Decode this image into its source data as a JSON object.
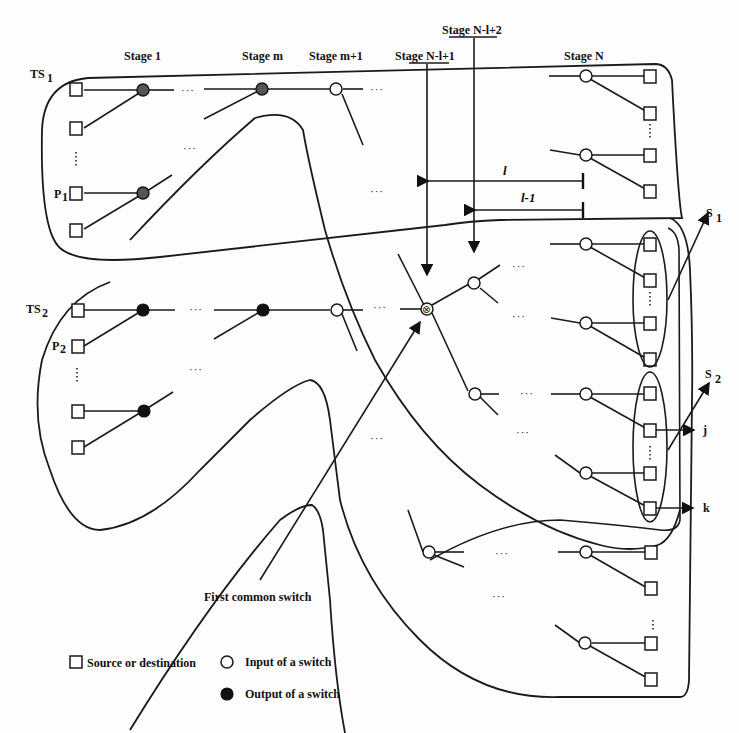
{
  "diagram": {
    "stage_labels": {
      "stage_1": "Stage 1",
      "stage_m": "Stage m",
      "stage_m1": "Stage m+1",
      "stage_nl1": "Stage N-l+1",
      "stage_nl2": "Stage N-l+2",
      "stage_n": "Stage N"
    },
    "group_labels": {
      "ts1": "TS",
      "ts1_sub": "1",
      "p1": "P",
      "p1_sub": "1",
      "ts2": "TS",
      "ts2_sub": "2",
      "p2": "P",
      "p2_sub": "2"
    },
    "dimension_labels": {
      "l": "l",
      "l_minus_1": "l-1"
    },
    "side_labels": {
      "s1": "S",
      "s1_sub": "1",
      "s2": "S",
      "s2_sub": "2",
      "j": "j",
      "k": "k"
    },
    "annotation": "First common switch",
    "ellipsis": "···"
  },
  "legend": {
    "source_destination": "Source or destination",
    "input_switch": "Input of a switch",
    "output_switch": "Output of a switch"
  }
}
